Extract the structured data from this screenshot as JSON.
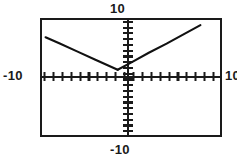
{
  "screen": {
    "device": "graphing-calculator-screen",
    "border_color": "#1a1a1a",
    "background_color": "#ffffff",
    "curve_color": "#111111"
  },
  "labels": {
    "top": "10",
    "left": "-10",
    "right": "10",
    "bottom": "-10"
  },
  "chart_data": {
    "type": "line",
    "title": "",
    "xlabel": "",
    "ylabel": "",
    "xlim": [
      -10,
      10
    ],
    "ylim": [
      -10,
      10
    ],
    "grid": false,
    "legend": "none",
    "axis_tick_spacing": 1,
    "x_tick_labels": [
      "-10",
      "10"
    ],
    "y_tick_labels": [
      "-10",
      "10"
    ],
    "annotations": [
      "V-shaped absolute value graph with vertex on the x-axis left of the origin"
    ],
    "series": [
      {
        "name": "left-branch",
        "comment": "descending ray from upper-left down to the vertex",
        "x": [
          -9.6,
          -8.0,
          -6.0,
          -4.0,
          -2.0,
          -1.5
        ],
        "y": [
          7.0,
          5.9,
          4.5,
          3.1,
          1.7,
          1.35
        ]
      },
      {
        "name": "right-branch",
        "comment": "ascending ray from the vertex up to the upper-right",
        "x": [
          -1.5,
          0.0,
          2.0,
          4.0,
          6.0,
          7.8
        ],
        "y": [
          1.35,
          2.6,
          4.3,
          5.9,
          7.6,
          9.1
        ]
      }
    ]
  }
}
